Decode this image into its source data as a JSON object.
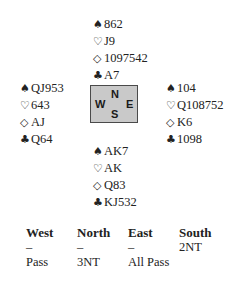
{
  "compass": {
    "north": "N",
    "west": "W",
    "east": "E",
    "south": "S",
    "fill_color": "#c9c9c9",
    "border_color": "#4a4a4a"
  },
  "hands": {
    "north": {
      "spades": "862",
      "hearts": "J9",
      "diamonds": "1097542",
      "clubs": "A7"
    },
    "west": {
      "spades": "QJ953",
      "hearts": "643",
      "diamonds": "AJ",
      "clubs": "Q64"
    },
    "east": {
      "spades": "104",
      "hearts": "Q108752",
      "diamonds": "K6",
      "clubs": "1098"
    },
    "south": {
      "spades": "AK7",
      "hearts": "AK",
      "diamonds": "Q83",
      "clubs": "KJ532"
    }
  },
  "suit_symbols": {
    "spades": "♠",
    "hearts": "♡",
    "diamonds": "◇",
    "clubs": "♣"
  },
  "bidding": {
    "headers": [
      "West",
      "North",
      "East",
      "South"
    ],
    "rows": [
      [
        "–",
        "–",
        "–",
        "2NT"
      ],
      [
        "Pass",
        "3NT",
        "All Pass",
        ""
      ]
    ]
  }
}
